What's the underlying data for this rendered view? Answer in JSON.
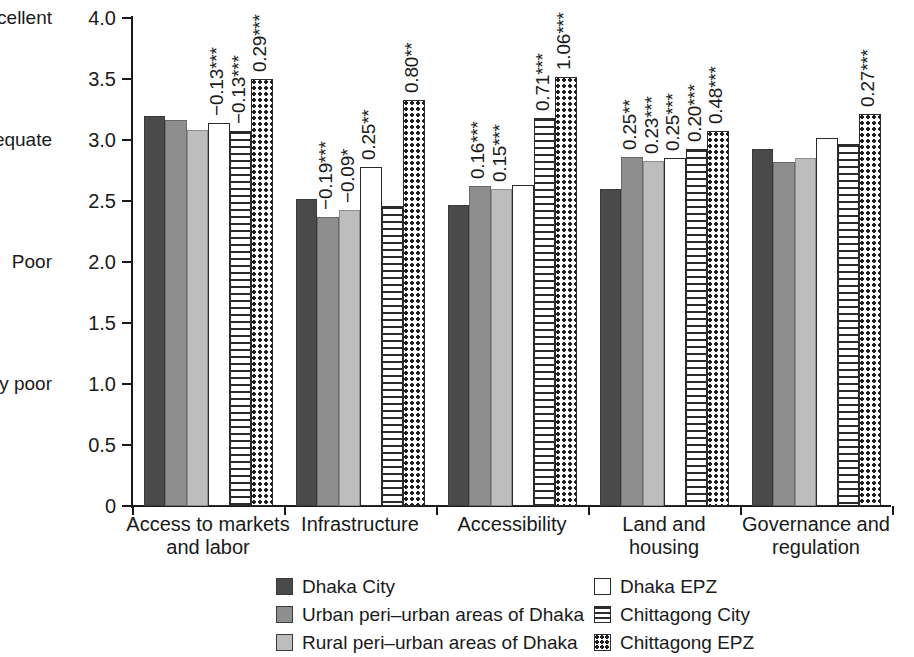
{
  "chart_data": {
    "type": "bar",
    "title": "",
    "xlabel": "",
    "ylabel": "",
    "ylim": [
      0,
      4.0
    ],
    "grid": false,
    "legend_position": "bottom",
    "categories": [
      "Access to markets and labor",
      "Infrastructure",
      "Accessibility",
      "Land and housing",
      "Governance and regulation"
    ],
    "category_lines": [
      [
        "Access to markets",
        "and labor"
      ],
      [
        "Infrastructure"
      ],
      [
        "Accessibility"
      ],
      [
        "Land and",
        "housing"
      ],
      [
        "Governance and",
        "regulation"
      ]
    ],
    "y_ticks": [
      "0",
      "0.5",
      "1.0",
      "1.5",
      "2.0",
      "2.5",
      "3.0",
      "3.5",
      "4.0"
    ],
    "y_tick_values": [
      0,
      0.5,
      1.0,
      1.5,
      2.0,
      2.5,
      3.0,
      3.5,
      4.0
    ],
    "y_scale_words": [
      {
        "label": "Very poor",
        "value": 1.0
      },
      {
        "label": "Poor",
        "value": 2.0
      },
      {
        "label": "Adequate",
        "value": 3.0
      },
      {
        "label": "Excellent",
        "value": 4.0
      }
    ],
    "series": [
      {
        "name": "Dhaka City",
        "pattern": "solid-dark",
        "color": "#4a4a4a",
        "values": [
          3.2,
          2.52,
          2.47,
          2.6,
          2.93
        ]
      },
      {
        "name": "Urban peri-urban areas of Dhaka",
        "pattern": "solid-medium",
        "color": "#8e8e8e",
        "values": [
          3.16,
          2.37,
          2.62,
          2.86,
          2.82
        ]
      },
      {
        "name": "Rural peri-urban areas of Dhaka",
        "pattern": "solid-light",
        "color": "#bdbdbd",
        "values": [
          3.08,
          2.43,
          2.6,
          2.83,
          2.85
        ]
      },
      {
        "name": "Dhaka EPZ",
        "pattern": "open",
        "color": "#ffffff",
        "values": [
          3.14,
          2.78,
          2.63,
          2.85,
          3.02
        ]
      },
      {
        "name": "Chittagong City",
        "pattern": "horizontal-lines",
        "color": "#ffffff",
        "values": [
          3.07,
          2.46,
          3.18,
          2.93,
          2.97
        ]
      },
      {
        "name": "Chittagong EPZ",
        "pattern": "checker-dots",
        "color": "#ffffff",
        "values": [
          3.5,
          3.33,
          3.52,
          3.07,
          3.21
        ]
      }
    ],
    "value_labels": [
      [
        {
          "series": 3,
          "text": "−0.13***"
        },
        {
          "series": 4,
          "text": "−0.13***"
        },
        {
          "series": 5,
          "text": "0.29***"
        }
      ],
      [
        {
          "series": 1,
          "text": "−0.19***"
        },
        {
          "series": 2,
          "text": "−0.09*"
        },
        {
          "series": 3,
          "text": "0.25**"
        },
        {
          "series": 5,
          "text": "0.80**"
        }
      ],
      [
        {
          "series": 1,
          "text": "0.16***"
        },
        {
          "series": 2,
          "text": "0.15***"
        },
        {
          "series": 4,
          "text": "0.71***"
        },
        {
          "series": 5,
          "text": "1.06***"
        }
      ],
      [
        {
          "series": 1,
          "text": "0.25**"
        },
        {
          "series": 2,
          "text": "0.23***"
        },
        {
          "series": 3,
          "text": "0.25***"
        },
        {
          "series": 4,
          "text": "0.20***"
        },
        {
          "series": 5,
          "text": "0.48***"
        }
      ],
      [
        {
          "series": 5,
          "text": "0.27***"
        }
      ]
    ]
  },
  "legend": {
    "left_column": [
      {
        "label": "Dhaka City",
        "series": 0
      },
      {
        "label": "Urban peri–urban areas of Dhaka",
        "series": 1
      },
      {
        "label": "Rural peri–urban areas of Dhaka",
        "series": 2
      }
    ],
    "right_column": [
      {
        "label": "Dhaka EPZ",
        "series": 3
      },
      {
        "label": "Chittagong City",
        "series": 4
      },
      {
        "label": "Chittagong EPZ",
        "series": 5
      }
    ]
  }
}
